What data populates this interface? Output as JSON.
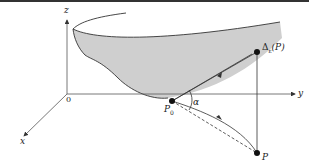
{
  "diagram": {
    "axes": {
      "z_label": "z",
      "y_label": "y",
      "x_label": "x",
      "origin_label": "0"
    },
    "points": {
      "p0_label": "P",
      "p0_sub": "0",
      "p_label": "P",
      "delta_label": "Δ",
      "delta_sub": "ε",
      "delta_arg": "(P)"
    },
    "angle_label": "α",
    "colors": {
      "surface_fill": "#cfcfcf",
      "line": "#333333",
      "background": "#ffffff"
    }
  }
}
